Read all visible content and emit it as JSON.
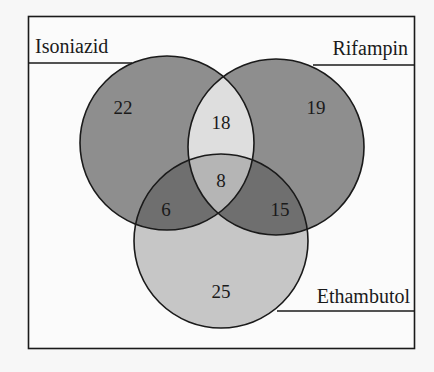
{
  "diagram": {
    "type": "venn-3",
    "sets": [
      {
        "name": "Isoniazid",
        "label_position": "top-left"
      },
      {
        "name": "Rifampin",
        "label_position": "top-right"
      },
      {
        "name": "Ethambutol",
        "label_position": "bottom-right"
      }
    ],
    "regions": {
      "isoniazid_only": "22",
      "rifampin_only": "19",
      "ethambutol_only": "25",
      "isoniazid_rifampin": "18",
      "isoniazid_ethambutol": "6",
      "rifampin_ethambutol": "15",
      "all_three": "8"
    },
    "colors": {
      "background": "#f7f7f7",
      "single_IR": "#8e8e8e",
      "single_E": "#c6c6c6",
      "overlap_IR": "#dedede",
      "overlap_IE_RE": "#6f6f6f",
      "center": "#b5b5b5",
      "stroke": "#1a1a1a"
    }
  }
}
